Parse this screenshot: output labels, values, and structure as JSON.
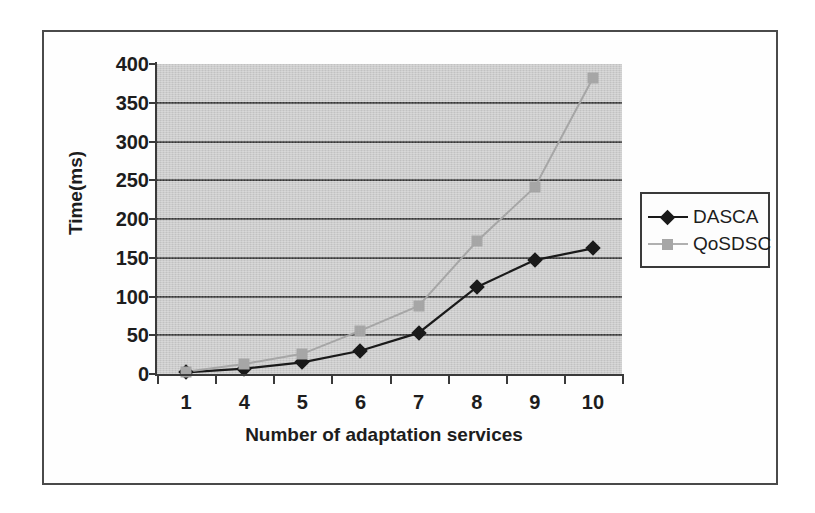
{
  "chart_data": {
    "type": "line",
    "title": "",
    "xlabel": "Number of adaptation services",
    "ylabel": "Time(ms)",
    "categories": [
      "1",
      "4",
      "5",
      "6",
      "7",
      "8",
      "9",
      "10"
    ],
    "ylim": [
      0,
      400
    ],
    "ytick_labels": [
      "0",
      "50",
      "100",
      "150",
      "200",
      "250",
      "300",
      "350",
      "400"
    ],
    "ytick_values": [
      0,
      50,
      100,
      150,
      200,
      250,
      300,
      350,
      400
    ],
    "grid": "horizontal",
    "legend_position": "right",
    "plot_background": "#c9c9c9",
    "series": [
      {
        "name": "DASCA",
        "color": "#1a1a1a",
        "marker": "diamond",
        "values": [
          2,
          7,
          15,
          30,
          53,
          112,
          147,
          162
        ]
      },
      {
        "name": "QoSDSC",
        "color": "#a6a6a6",
        "marker": "square",
        "values": [
          3,
          13,
          26,
          56,
          88,
          171,
          241,
          382
        ]
      }
    ]
  },
  "legend": {
    "items": [
      {
        "label": "DASCA"
      },
      {
        "label": "QoSDSC"
      }
    ]
  }
}
